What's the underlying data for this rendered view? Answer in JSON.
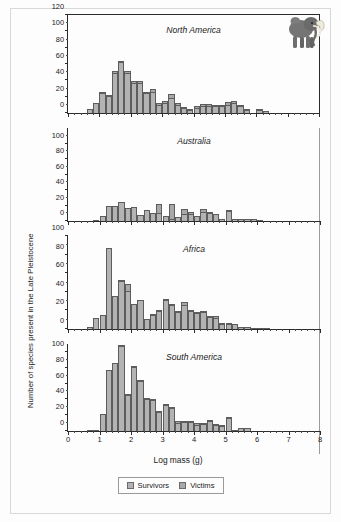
{
  "figure": {
    "xaxis_title": "Log mass (g)",
    "yaxis_title": "Number of species present in the Late Pleistocene",
    "illustration": "mammoth-illustration"
  },
  "legend": {
    "position": "bottom-center",
    "items": [
      {
        "label": "Survivors",
        "color": "#b3b3b3"
      },
      {
        "label": "Victims",
        "color": "#a8a8a8"
      }
    ]
  },
  "chart_data": {
    "type": "bar",
    "title": "",
    "xlabel": "Log mass (g)",
    "ylabel": "Number of species present in the Late Pleistocene",
    "xlim": [
      0,
      8
    ],
    "bin_width": 0.2,
    "grid": false,
    "stacked": true,
    "legend_position": "bottom-center",
    "xticks": [
      0,
      1,
      2,
      3,
      4,
      5,
      6,
      7,
      8
    ],
    "xticklabels": [
      "0",
      "1",
      "2",
      "3",
      "4",
      "5",
      "6",
      "7",
      "8"
    ],
    "panels": [
      {
        "name": "North America",
        "ylim": [
          0,
          120
        ],
        "yticks": [
          0,
          20,
          40,
          60,
          80,
          100,
          120
        ],
        "yticklabels": [
          "0",
          "20",
          "40",
          "60",
          "80",
          "100",
          "120"
        ],
        "bins": [
          0.6,
          0.8,
          1.0,
          1.2,
          1.4,
          1.6,
          1.8,
          2.0,
          2.2,
          2.4,
          2.6,
          2.8,
          3.0,
          3.2,
          3.4,
          3.6,
          3.8,
          4.0,
          4.2,
          4.4,
          4.6,
          4.8,
          5.0,
          5.2,
          5.4,
          5.6,
          5.8,
          6.0,
          6.2,
          6.4,
          6.6
        ],
        "series": [
          {
            "name": "Survivors",
            "values": [
              5,
              12,
              25,
              21,
              49,
              62,
              49,
              37,
              37,
              24,
              26,
              10,
              12,
              18,
              10,
              6,
              4,
              6,
              9,
              8,
              8,
              8,
              10,
              12,
              9,
              4,
              0,
              4,
              3,
              0,
              0
            ]
          },
          {
            "name": "Victims",
            "values": [
              0,
              0,
              1,
              1,
              3,
              2,
              3,
              2,
              2,
              1,
              3,
              2,
              3,
              5,
              2,
              1,
              1,
              3,
              2,
              3,
              1,
              1,
              4,
              3,
              1,
              1,
              0,
              1,
              0,
              0,
              0
            ]
          }
        ]
      },
      {
        "name": "Australia",
        "ylim": [
          0,
          120
        ],
        "yticks": [
          0,
          20,
          40,
          60,
          80,
          100
        ],
        "yticklabels": [
          "0",
          "20",
          "40",
          "60",
          "80",
          "100"
        ],
        "bins": [
          0.8,
          1.0,
          1.2,
          1.4,
          1.6,
          1.8,
          2.0,
          2.2,
          2.4,
          2.6,
          2.8,
          3.0,
          3.2,
          3.4,
          3.6,
          3.8,
          4.0,
          4.2,
          4.4,
          4.6,
          4.8,
          5.0,
          5.2,
          5.4,
          5.6,
          5.8,
          6.0,
          6.2
        ],
        "series": [
          {
            "name": "Survivors",
            "values": [
              1,
              7,
              19,
              19,
              24,
              17,
              18,
              8,
              14,
              10,
              10,
              6,
              3,
              5,
              9,
              9,
              6,
              12,
              10,
              9,
              3,
              13,
              2,
              3,
              3,
              3,
              1,
              0
            ]
          },
          {
            "name": "Victims",
            "values": [
              0,
              0,
              0,
              0,
              0,
              0,
              0,
              0,
              0,
              0,
              12,
              0,
              19,
              0,
              6,
              3,
              0,
              3,
              1,
              0,
              0,
              1,
              0,
              0,
              0,
              0,
              0,
              0
            ]
          }
        ]
      },
      {
        "name": "Africa",
        "ylim": [
          0,
          100
        ],
        "yticks": [
          0,
          20,
          40,
          60,
          80,
          100
        ],
        "yticklabels": [
          "0",
          "20",
          "40",
          "60",
          "80",
          "100"
        ],
        "bins": [
          0.6,
          0.8,
          1.0,
          1.2,
          1.4,
          1.6,
          1.8,
          2.0,
          2.2,
          2.4,
          2.6,
          2.8,
          3.0,
          3.2,
          3.4,
          3.6,
          3.8,
          4.0,
          4.2,
          4.4,
          4.6,
          4.8,
          5.0,
          5.2,
          5.4,
          5.6,
          5.8,
          6.0,
          6.2,
          6.4,
          6.6,
          6.8
        ],
        "series": [
          {
            "name": "Survivors",
            "values": [
              2,
              12,
              15,
              87,
              36,
              52,
              41,
              27,
              31,
              11,
              15,
              19,
              31,
              26,
              18,
              26,
              19,
              17,
              18,
              13,
              12,
              5,
              5,
              5,
              2,
              2,
              1,
              1,
              1,
              0,
              0,
              0
            ]
          },
          {
            "name": "Victims",
            "values": [
              0,
              0,
              0,
              0,
              0,
              1,
              7,
              0,
              0,
              0,
              1,
              1,
              1,
              1,
              1,
              3,
              1,
              1,
              1,
              1,
              2,
              1,
              1,
              0,
              0,
              0,
              0,
              0,
              0,
              0,
              0,
              0
            ]
          }
        ]
      },
      {
        "name": "South America",
        "ylim": [
          0,
          110
        ],
        "yticks": [
          0,
          20,
          40,
          60,
          80,
          100
        ],
        "yticklabels": [
          "0",
          "20",
          "40",
          "60",
          "80",
          "100"
        ],
        "bins": [
          0.6,
          0.8,
          1.0,
          1.2,
          1.4,
          1.6,
          1.8,
          2.0,
          2.2,
          2.4,
          2.6,
          2.8,
          3.0,
          3.2,
          3.4,
          3.6,
          3.8,
          4.0,
          4.2,
          4.4,
          4.6,
          4.8,
          5.0,
          5.2,
          5.4,
          5.6,
          5.8,
          6.0,
          6.2,
          6.4,
          6.6,
          6.8
        ],
        "series": [
          {
            "name": "Survivors",
            "values": [
              1,
              1,
              21,
              77,
              86,
              107,
              46,
              81,
              63,
              41,
              39,
              24,
              33,
              29,
              10,
              11,
              12,
              7,
              9,
              13,
              7,
              6,
              16,
              1,
              4,
              4,
              0,
              0,
              0,
              0,
              0,
              0
            ]
          },
          {
            "name": "Victims",
            "values": [
              0,
              0,
              0,
              0,
              0,
              2,
              1,
              1,
              1,
              1,
              1,
              1,
              1,
              2,
              3,
              1,
              1,
              3,
              1,
              1,
              1,
              1,
              1,
              0,
              0,
              0,
              0,
              0,
              0,
              0,
              0,
              0
            ]
          }
        ]
      }
    ]
  }
}
